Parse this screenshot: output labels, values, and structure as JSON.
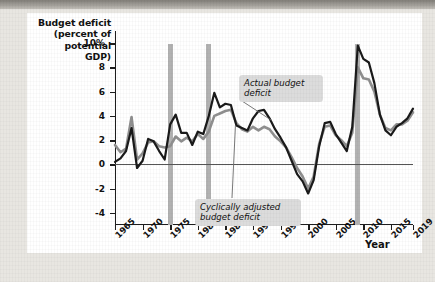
{
  "figure": {
    "y_axis_title": "Budget deficit\n(percent of\npotential\nGDP)",
    "x_axis_title": "Year",
    "callout_actual": "Actual budget\ndeficit",
    "callout_cyclical": "Cyclically adjusted\nbudget deficit",
    "colors": {
      "actual_line": "#1a1a1a",
      "cyclical_line": "#8f8f8f",
      "recession_bar": "#b2b2b2",
      "card_background": "#ffffff",
      "page_background": "#e8e6e1",
      "callout_background": "#dcdcdc"
    }
  },
  "chart_data": {
    "type": "line",
    "title": "",
    "xlabel": "Year",
    "ylabel": "Budget deficit (percent of potential GDP)",
    "xlim": [
      1965,
      2019
    ],
    "ylim": [
      -5,
      11
    ],
    "yticks": [
      "10%",
      "8",
      "6",
      "4",
      "2",
      "0",
      "-2",
      "-4"
    ],
    "ytick_values": [
      10,
      8,
      6,
      4,
      2,
      0,
      -2,
      -4
    ],
    "xticks": [
      "1965",
      "1970",
      "1975",
      "1980",
      "1985",
      "1990",
      "1995",
      "2000",
      "2005",
      "2010",
      "2015",
      "2019"
    ],
    "xtick_values": [
      1965,
      1970,
      1975,
      1980,
      1985,
      1990,
      1995,
      2000,
      2005,
      2010,
      2015,
      2019
    ],
    "grid": false,
    "legend_position": "annotations",
    "annotations": [
      {
        "text": "Actual budget deficit",
        "points_to_year": 1993
      },
      {
        "text": "Cyclically adjusted budget deficit",
        "points_to_year": 1987
      }
    ],
    "recession_bands": [
      1975,
      1982,
      2009
    ],
    "x": [
      1965,
      1966,
      1967,
      1968,
      1969,
      1970,
      1971,
      1972,
      1973,
      1974,
      1975,
      1976,
      1977,
      1978,
      1979,
      1980,
      1981,
      1982,
      1983,
      1984,
      1985,
      1986,
      1987,
      1988,
      1989,
      1990,
      1991,
      1992,
      1993,
      1994,
      1995,
      1996,
      1997,
      1998,
      1999,
      2000,
      2001,
      2002,
      2003,
      2004,
      2005,
      2006,
      2007,
      2008,
      2009,
      2010,
      2011,
      2012,
      2013,
      2014,
      2015,
      2016,
      2017,
      2018,
      2019
    ],
    "series": [
      {
        "name": "Actual budget deficit",
        "color": "#1a1a1a",
        "values": [
          0.2,
          0.5,
          1.1,
          3.0,
          -0.3,
          0.3,
          2.1,
          1.9,
          1.1,
          0.4,
          3.3,
          4.1,
          2.6,
          2.6,
          1.6,
          2.7,
          2.5,
          4.0,
          5.9,
          4.7,
          5.0,
          4.9,
          3.2,
          3.0,
          2.8,
          3.8,
          4.4,
          4.5,
          3.8,
          2.9,
          2.2,
          1.4,
          0.3,
          -0.8,
          -1.4,
          -2.4,
          -1.3,
          1.5,
          3.4,
          3.5,
          2.5,
          1.8,
          1.1,
          3.1,
          9.8,
          8.7,
          8.4,
          6.7,
          4.1,
          2.8,
          2.4,
          3.1,
          3.4,
          3.8,
          4.6
        ]
      },
      {
        "name": "Cyclically adjusted budget deficit",
        "color": "#8f8f8f",
        "values": [
          1.6,
          1.0,
          1.3,
          3.9,
          0.4,
          0.9,
          1.8,
          1.9,
          1.5,
          1.4,
          1.5,
          2.3,
          1.9,
          2.2,
          1.9,
          2.5,
          2.1,
          2.7,
          4.0,
          4.2,
          4.4,
          4.5,
          3.4,
          2.9,
          2.7,
          3.1,
          2.8,
          3.1,
          2.9,
          2.3,
          1.9,
          1.4,
          0.6,
          -0.3,
          -1.0,
          -2.0,
          -1.0,
          1.7,
          3.1,
          3.2,
          2.4,
          2.0,
          1.5,
          2.6,
          8.0,
          7.1,
          7.0,
          6.0,
          4.1,
          3.0,
          2.8,
          3.3,
          3.3,
          3.6,
          4.3
        ]
      }
    ]
  }
}
